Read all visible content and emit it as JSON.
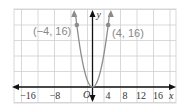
{
  "chart_data": {
    "type": "line",
    "title": "",
    "function": "y = x^2",
    "xlabel": "x",
    "ylabel": "y",
    "origin_label": "O",
    "xlim": [
      -18,
      20
    ],
    "ylim": [
      -2,
      20
    ],
    "grid": true,
    "grid_step": 4,
    "x_tick_labels": [
      "-16",
      "-8",
      "4",
      "8",
      "12",
      "16"
    ],
    "x_ticks": [
      -16,
      -8,
      4,
      8,
      12,
      16
    ],
    "series": [
      {
        "name": "parabola",
        "color": "#8c8c8c",
        "x": [
          -4.5,
          -4,
          -3,
          -2,
          -1,
          0,
          1,
          2,
          3,
          4,
          4.5
        ],
        "y": [
          20.25,
          16,
          9,
          4,
          1,
          0,
          1,
          4,
          9,
          16,
          20.25
        ]
      }
    ],
    "annotations": [
      {
        "label": "(−4, 16)",
        "x": -4,
        "y": 16
      },
      {
        "label": "(4, 16)",
        "x": 4,
        "y": 16
      }
    ]
  },
  "colors": {
    "grid": "#cfcfcf",
    "axis": "#111111",
    "curve": "#8c8c8c"
  }
}
